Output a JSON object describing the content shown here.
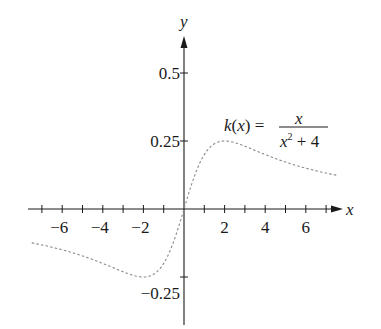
{
  "chart_data": {
    "type": "line",
    "title": "",
    "function_label": {
      "lhs": "k(x) =",
      "numerator": "x",
      "denominator_base": "x",
      "denominator_exp": "2",
      "denominator_rest": " + 4"
    },
    "xlabel": "x",
    "ylabel": "y",
    "xlim": [
      -7.8,
      7.5
    ],
    "ylim": [
      -0.42,
      0.62
    ],
    "x_ticks": [
      -7,
      -6,
      -5,
      -4,
      -3,
      -2,
      -1,
      1,
      2,
      3,
      4,
      5,
      6,
      7
    ],
    "x_tick_labels": [
      {
        "value": -6,
        "label": "−6"
      },
      {
        "value": -4,
        "label": "−4"
      },
      {
        "value": -2,
        "label": "−2"
      },
      {
        "value": 2,
        "label": "2"
      },
      {
        "value": 4,
        "label": "4"
      },
      {
        "value": 6,
        "label": "6"
      }
    ],
    "y_ticks": [
      -0.25,
      0.25,
      0.5
    ],
    "y_tick_labels": [
      {
        "value": 0.5,
        "label": "0.5"
      },
      {
        "value": 0.25,
        "label": "0.25"
      },
      {
        "value": -0.25,
        "label": "−0.25"
      }
    ],
    "grid": false,
    "line_style": "dashed",
    "series": [
      {
        "name": "k(x) = x/(x^2+4)",
        "x": [
          -7.5,
          -7,
          -6,
          -5,
          -4,
          -3,
          -2,
          -1.5,
          -1,
          -0.5,
          0,
          0.5,
          1,
          1.5,
          2,
          3,
          4,
          5,
          6,
          7,
          7.5
        ],
        "values": [
          -0.124,
          -0.132,
          -0.15,
          -0.172,
          -0.2,
          -0.231,
          -0.25,
          -0.24,
          -0.2,
          -0.118,
          0,
          0.118,
          0.2,
          0.24,
          0.25,
          0.231,
          0.2,
          0.172,
          0.15,
          0.132,
          0.124
        ]
      }
    ]
  }
}
